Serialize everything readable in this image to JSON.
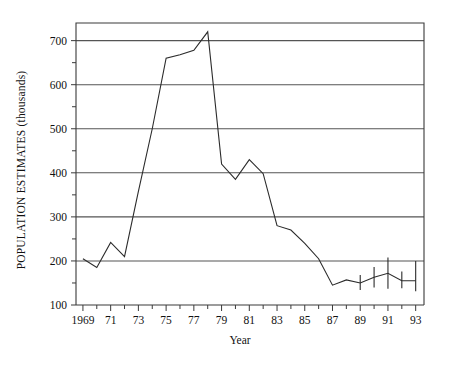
{
  "chart_data": {
    "type": "line",
    "title": "",
    "xlabel": "Year",
    "ylabel": "POPULATION ESTIMATES (thousands)",
    "xlim": [
      1968.5,
      1993.6
    ],
    "ylim": [
      100,
      740
    ],
    "grid": "horizontal-major",
    "legend": "none",
    "y_major_ticks": [
      100,
      200,
      300,
      400,
      500,
      600,
      700
    ],
    "y_minor_ticks": [
      150,
      250,
      350,
      450,
      550,
      650
    ],
    "y_tick_labels": [
      "100",
      "200",
      "300",
      "400",
      "500",
      "600",
      "700"
    ],
    "x_ticks": [
      1969,
      1970,
      1971,
      1972,
      1973,
      1974,
      1975,
      1976,
      1977,
      1978,
      1979,
      1980,
      1981,
      1982,
      1983,
      1984,
      1985,
      1986,
      1987,
      1988,
      1989,
      1990,
      1991,
      1992,
      1993
    ],
    "x_tick_labels": [
      {
        "x": 1969,
        "label": "1969"
      },
      {
        "x": 1971,
        "label": "71"
      },
      {
        "x": 1973,
        "label": "73"
      },
      {
        "x": 1975,
        "label": "75"
      },
      {
        "x": 1977,
        "label": "77"
      },
      {
        "x": 1979,
        "label": "79"
      },
      {
        "x": 1981,
        "label": "81"
      },
      {
        "x": 1983,
        "label": "83"
      },
      {
        "x": 1985,
        "label": "85"
      },
      {
        "x": 1987,
        "label": "87"
      },
      {
        "x": 1989,
        "label": "89"
      },
      {
        "x": 1991,
        "label": "91"
      },
      {
        "x": 1993,
        "label": "93"
      }
    ],
    "x": [
      1969,
      1970,
      1971,
      1972,
      1973,
      1974,
      1975,
      1976,
      1977,
      1978,
      1979,
      1980,
      1981,
      1982,
      1983,
      1984,
      1985,
      1986,
      1987,
      1988,
      1989,
      1990,
      1991,
      1992,
      1993
    ],
    "values": [
      205,
      185,
      242,
      210,
      358,
      500,
      660,
      668,
      678,
      720,
      420,
      385,
      430,
      398,
      280,
      270,
      240,
      205,
      145,
      157,
      150,
      163,
      172,
      155,
      155
    ],
    "error_bars": [
      {
        "x": 1989,
        "y": 150,
        "low": 134,
        "high": 168
      },
      {
        "x": 1990,
        "y": 163,
        "low": 140,
        "high": 186
      },
      {
        "x": 1991,
        "y": 172,
        "low": 137,
        "high": 208
      },
      {
        "x": 1992,
        "y": 155,
        "low": 138,
        "high": 176
      },
      {
        "x": 1993,
        "y": 155,
        "low": 131,
        "high": 200
      }
    ]
  }
}
